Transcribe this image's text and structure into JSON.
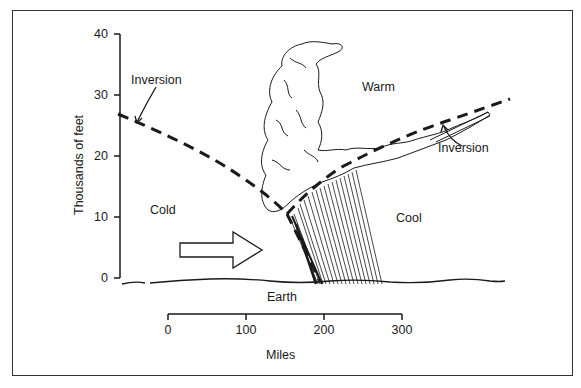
{
  "figure": {
    "y_axis": {
      "label": "Thousands of feet",
      "ticks": [
        "0",
        "10",
        "20",
        "30",
        "40"
      ]
    },
    "x_scale": {
      "label": "Miles",
      "ticks": [
        "0",
        "100",
        "200",
        "300"
      ]
    },
    "regions": {
      "cold": "Cold",
      "warm": "Warm",
      "cool": "Cool",
      "earth": "Earth"
    },
    "annotations": {
      "inversion_left": "Inversion",
      "inversion_right": "Inversion"
    },
    "arrow": {
      "direction": "right",
      "meaning": "cold-air-movement"
    },
    "colors": {
      "ink": "#1a1a1a",
      "background": "#ffffff"
    }
  }
}
